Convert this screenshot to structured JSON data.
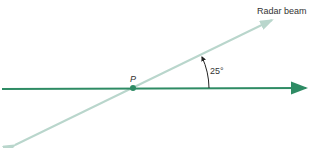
{
  "diagram": {
    "beam_label": "Radar beam",
    "angle_label": "25°",
    "angle_degrees": 25,
    "point_label": "P",
    "colors": {
      "ground_line": "#2e8b64",
      "beam": "#b9d6cc",
      "text": "#333333"
    }
  }
}
